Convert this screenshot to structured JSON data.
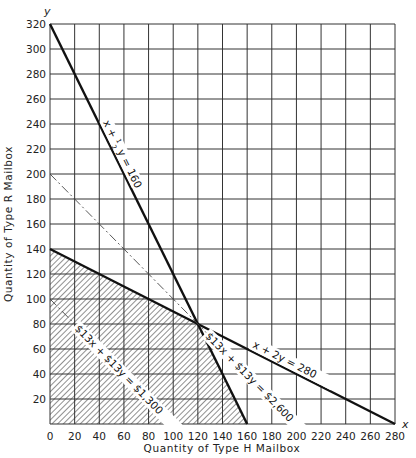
{
  "chart_data": {
    "type": "line",
    "title": "",
    "xlabel": "Quantity of Type H Mailbox",
    "ylabel": "Quantity of Type R Mailbox",
    "x_axis_letter": "x",
    "y_axis_letter": "y",
    "xlim": [
      0,
      280
    ],
    "ylim": [
      0,
      320
    ],
    "x_ticks": [
      0,
      20,
      40,
      60,
      80,
      100,
      120,
      140,
      160,
      180,
      200,
      220,
      240,
      260,
      280
    ],
    "y_ticks": [
      20,
      40,
      60,
      80,
      100,
      120,
      140,
      160,
      180,
      200,
      220,
      240,
      260,
      280,
      300,
      320
    ],
    "origin_label": "0",
    "grid": true,
    "series": [
      {
        "name": "x + 1/2 y = 160",
        "label_parts": [
          "x + ",
          "1",
          "2",
          "y = 160"
        ],
        "style": "solid-bold",
        "points": [
          [
            0,
            320
          ],
          [
            160,
            0
          ]
        ]
      },
      {
        "name": "x + 2y = 280",
        "label": "x + 2y = 280",
        "style": "solid-bold",
        "points": [
          [
            0,
            140
          ],
          [
            280,
            0
          ]
        ]
      },
      {
        "name": "$13x + $13y = $1,300",
        "label": "$13x + $13y = $1,300",
        "style": "dash-dot",
        "points": [
          [
            0,
            100
          ],
          [
            100,
            0
          ]
        ]
      },
      {
        "name": "$13x + $13y = $2,600",
        "label": "$13x + $13y = $2,600",
        "style": "dash-dot",
        "points": [
          [
            0,
            200
          ],
          [
            200,
            0
          ]
        ]
      }
    ],
    "feasible_region": {
      "fill": "hatched",
      "vertices": [
        [
          0,
          0
        ],
        [
          0,
          140
        ],
        [
          120,
          80
        ],
        [
          160,
          0
        ]
      ]
    },
    "optimal_point": [
      120,
      80
    ]
  }
}
